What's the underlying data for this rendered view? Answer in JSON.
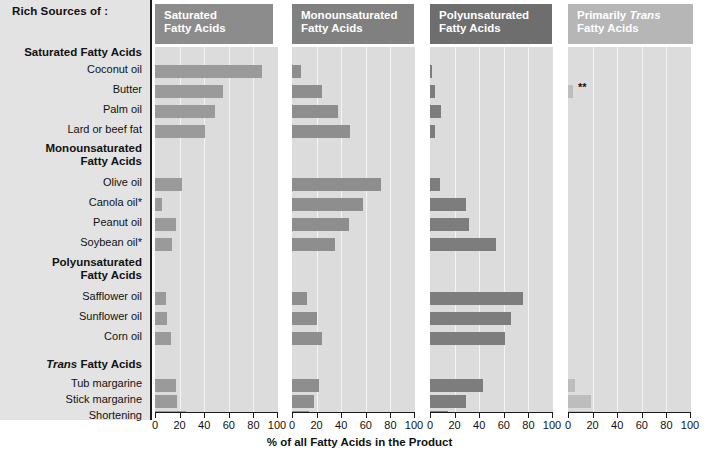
{
  "labels": {
    "rich_sources_title": "Rich Sources of :",
    "axis_title": "% of all Fatty Acids in the Product",
    "groups": [
      {
        "heading": "Saturated Fatty Acids",
        "rows": [
          "Coconut oil",
          "Butter",
          "Palm oil",
          "Lard or beef fat"
        ]
      },
      {
        "heading": "Monounsaturated\nFatty Acids",
        "rows": [
          "Olive oil",
          "Canola oil*",
          "Peanut oil",
          "Soybean oil*"
        ]
      },
      {
        "heading": "Polyunsaturated\nFatty Acids",
        "rows": [
          "Safflower oil",
          "Sunflower oil",
          "Corn oil"
        ]
      },
      {
        "heading": "Trans Fatty Acids",
        "heading_italic_word": "Trans",
        "rows": [
          "Tub margarine",
          "Stick margarine",
          "Shortening"
        ]
      }
    ],
    "annotation_marker": "**"
  },
  "panels": [
    {
      "title": "Saturated\nFatty Acids",
      "header_color": "#8c8c8c",
      "bar_color": "#9a9a9a"
    },
    {
      "title": "Monounsaturated\nFatty Acids",
      "header_color": "#808080",
      "bar_color": "#8e8e8e"
    },
    {
      "title": "Polyunsaturated\nFatty Acids",
      "header_color": "#6e6e6e",
      "bar_color": "#7d7d7d"
    },
    {
      "title": "Primarily Trans\nFatty Acids",
      "header_color": "#b6b6b6",
      "bar_color": "#bdbdbd",
      "italic_word": "Trans"
    }
  ],
  "chart_data": {
    "type": "bar",
    "xlabel": "% of all Fatty Acids in the Product",
    "ylabel": "",
    "xlim": [
      0,
      100
    ],
    "xticks": [
      0,
      20,
      40,
      60,
      80,
      100
    ],
    "xtick_labels": [
      "0",
      "20",
      "40",
      "60",
      "80",
      "100"
    ],
    "grid": true,
    "legend_position": "column-headers",
    "orientation": "horizontal",
    "categories": [
      "Coconut oil",
      "Butter",
      "Palm oil",
      "Lard or beef fat",
      "Olive oil",
      "Canola oil*",
      "Peanut oil",
      "Soybean oil*",
      "Safflower oil",
      "Sunflower oil",
      "Corn oil",
      "Tub margarine",
      "Stick margarine",
      "Shortening"
    ],
    "category_groups": [
      {
        "name": "Saturated Fatty Acids",
        "members": [
          "Coconut oil",
          "Butter",
          "Palm oil",
          "Lard or beef fat"
        ]
      },
      {
        "name": "Monounsaturated Fatty Acids",
        "members": [
          "Olive oil",
          "Canola oil*",
          "Peanut oil",
          "Soybean oil*"
        ]
      },
      {
        "name": "Polyunsaturated Fatty Acids",
        "members": [
          "Safflower oil",
          "Sunflower oil",
          "Corn oil"
        ]
      },
      {
        "name": "Trans Fatty Acids",
        "members": [
          "Tub margarine",
          "Stick margarine",
          "Shortening"
        ]
      }
    ],
    "series": [
      {
        "name": "Saturated Fatty Acids",
        "values": [
          87,
          55,
          49,
          41,
          22,
          6,
          17,
          14,
          9,
          10,
          13,
          17,
          18,
          25
        ]
      },
      {
        "name": "Monounsaturated Fatty Acids",
        "values": [
          7,
          24,
          37,
          47,
          72,
          58,
          46,
          35,
          12,
          20,
          24,
          22,
          18,
          14
        ]
      },
      {
        "name": "Polyunsaturated Fatty Acids",
        "values": [
          2,
          4,
          9,
          4,
          8,
          29,
          32,
          54,
          76,
          66,
          61,
          43,
          29,
          15
        ]
      },
      {
        "name": "Primarily Trans Fatty Acids",
        "values": [
          0,
          4,
          0,
          0,
          0,
          0,
          0,
          0,
          0,
          0,
          0,
          6,
          19,
          20
        ]
      }
    ],
    "notes": [
      "** marks the Butter value in the Primarily Trans Fatty Acids panel"
    ]
  }
}
